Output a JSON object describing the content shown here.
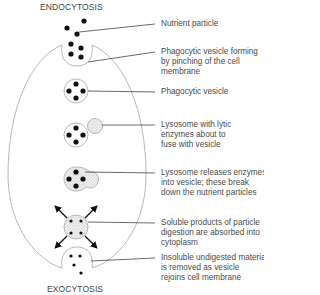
{
  "diagram": {
    "top_title": "ENDOCYTOSIS",
    "bottom_title": "EXOCYTOSIS",
    "colors": {
      "outline": "#b8b8b8",
      "particle": "#111111",
      "lysosome_fill": "#e8e8e8",
      "leader_line": "#444444",
      "text": "#4a4a4a"
    },
    "labels": [
      {
        "id": "nutrient-particle",
        "lines": [
          "Nutrient particle"
        ]
      },
      {
        "id": "vesicle-forming",
        "lines": [
          "Phagocytic vesicle forming",
          "by pinching of the cell",
          "membrane"
        ]
      },
      {
        "id": "phagocytic-vesicle",
        "lines": [
          "Phagocytic vesicle"
        ]
      },
      {
        "id": "lysosome-fuse",
        "lines": [
          "Lysosome with lytic",
          "enzymes about to",
          "fuse with vesicle"
        ]
      },
      {
        "id": "lysosome-release",
        "lines": [
          "Lysosome releases enzymes",
          "into vesicle; these break",
          "down the nutrient particles"
        ]
      },
      {
        "id": "soluble-products",
        "lines": [
          "Soluble products of particle",
          "digestion are absorbed into",
          "cytoplasm"
        ]
      },
      {
        "id": "insoluble-material",
        "lines": [
          "Insoluble undigested material",
          "is removed as vesicle",
          "rejoins cell membrane"
        ]
      }
    ]
  }
}
